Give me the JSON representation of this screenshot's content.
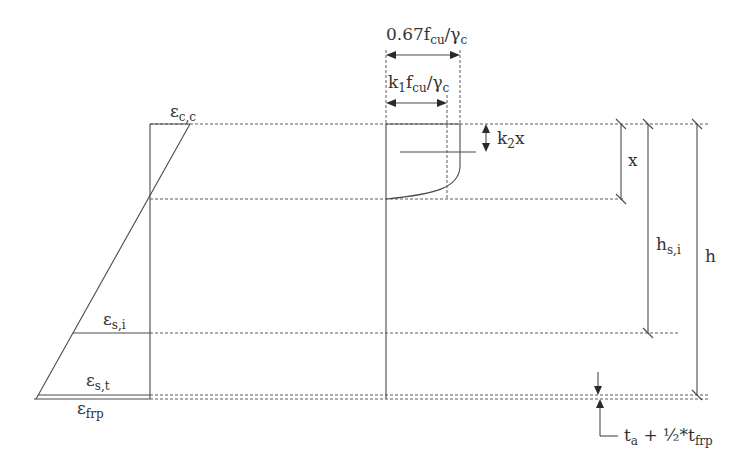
{
  "diagram": {
    "strain_labels": {
      "concrete_top": {
        "symbol": "ε",
        "subscript": "c,c"
      },
      "steel_i": {
        "symbol": "ε",
        "subscript": "s,i"
      },
      "steel_t": {
        "symbol": "ε",
        "subscript": "s,t"
      },
      "frp": {
        "symbol": "ε",
        "subscript": "frp"
      }
    },
    "stress_labels": {
      "peak": {
        "prefix": "0.67f",
        "sub1": "cu",
        "mid": "/γ",
        "sub2": "c"
      },
      "avg": {
        "k": "k",
        "ksub": "1",
        "f": "f",
        "sub1": "cu",
        "mid": "/γ",
        "sub2": "c"
      },
      "centroid": {
        "k": "k",
        "ksub": "2",
        "rest": "x"
      }
    },
    "dimension_labels": {
      "neutral_axis": "x",
      "steel_depth": {
        "base": "h",
        "subscript": "s,i"
      },
      "total_depth": "h",
      "frp_offset": {
        "t": "t",
        "tsub": "a",
        "mid": " + ½*t",
        "sub2": "frp"
      }
    }
  }
}
